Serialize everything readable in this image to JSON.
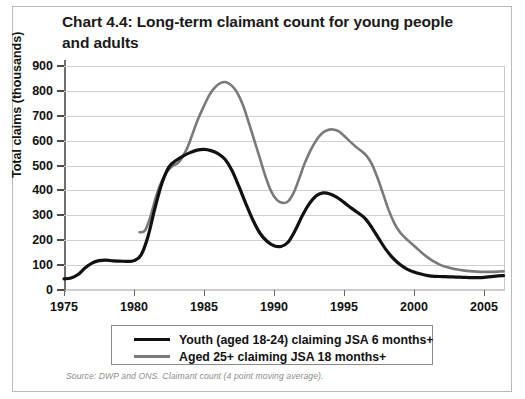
{
  "figure": {
    "title": "Chart 4.4: Long-term claimant count for young people and adults",
    "source_note": "Source: DWP and ONS. Claimant count (4 point moving average)."
  },
  "legend": {
    "items": [
      {
        "label": "Youth (aged 18-24) claiming JSA 6 months+",
        "color": "#111111",
        "series": "youth"
      },
      {
        "label": "Aged 25+ claiming JSA 18 months+",
        "color": "#7a7a7a",
        "series": "adults"
      }
    ]
  },
  "axis": {
    "y_title": "Total claims (thousands)",
    "y_ticks": [
      "900",
      "800",
      "700",
      "600",
      "500",
      "400",
      "300",
      "200",
      "100",
      "0"
    ],
    "x_ticks": [
      "1975",
      "1980",
      "1985",
      "1990",
      "1995",
      "2000",
      "2005"
    ]
  },
  "chart_data": {
    "type": "line",
    "title": "Chart 4.4: Long-term claimant count for young people and adults",
    "xlabel": "",
    "ylabel": "Total claims (thousands)",
    "xlim": [
      1975,
      2006.5
    ],
    "ylim": [
      0,
      900
    ],
    "yticks": [
      0,
      100,
      200,
      300,
      400,
      500,
      600,
      700,
      800,
      900
    ],
    "xticks": [
      1975,
      1980,
      1985,
      1990,
      1995,
      2000,
      2005
    ],
    "grid": "horizontal",
    "legend_position": "below-plot",
    "annotation": "Source: DWP and ONS. Claimant count (4 point moving average).",
    "series": [
      {
        "name": "Youth (aged 18-24) claiming JSA 6 months+",
        "color": "#111111",
        "points": [
          [
            1975.0,
            45
          ],
          [
            1975.5,
            48
          ],
          [
            1976.0,
            62
          ],
          [
            1976.5,
            88
          ],
          [
            1977.0,
            108
          ],
          [
            1977.5,
            118
          ],
          [
            1978.0,
            120
          ],
          [
            1978.5,
            117
          ],
          [
            1979.0,
            116
          ],
          [
            1979.5,
            115
          ],
          [
            1980.0,
            118
          ],
          [
            1980.5,
            140
          ],
          [
            1981.0,
            215
          ],
          [
            1981.5,
            330
          ],
          [
            1982.0,
            430
          ],
          [
            1982.5,
            495
          ],
          [
            1983.0,
            520
          ],
          [
            1983.5,
            538
          ],
          [
            1984.0,
            552
          ],
          [
            1984.5,
            562
          ],
          [
            1985.0,
            565
          ],
          [
            1985.5,
            560
          ],
          [
            1986.0,
            548
          ],
          [
            1986.5,
            525
          ],
          [
            1987.0,
            480
          ],
          [
            1987.5,
            415
          ],
          [
            1988.0,
            345
          ],
          [
            1988.5,
            280
          ],
          [
            1989.0,
            228
          ],
          [
            1989.5,
            196
          ],
          [
            1990.0,
            178
          ],
          [
            1990.5,
            175
          ],
          [
            1991.0,
            192
          ],
          [
            1991.5,
            238
          ],
          [
            1992.0,
            296
          ],
          [
            1992.5,
            345
          ],
          [
            1993.0,
            378
          ],
          [
            1993.5,
            390
          ],
          [
            1994.0,
            386
          ],
          [
            1994.5,
            372
          ],
          [
            1995.0,
            352
          ],
          [
            1995.5,
            330
          ],
          [
            1996.0,
            310
          ],
          [
            1996.5,
            288
          ],
          [
            1997.0,
            250
          ],
          [
            1997.5,
            205
          ],
          [
            1998.0,
            162
          ],
          [
            1998.5,
            128
          ],
          [
            1999.0,
            102
          ],
          [
            1999.5,
            84
          ],
          [
            2000.0,
            72
          ],
          [
            2000.5,
            64
          ],
          [
            2001.0,
            58
          ],
          [
            2001.5,
            55
          ],
          [
            2002.0,
            54
          ],
          [
            2002.5,
            53
          ],
          [
            2003.0,
            52
          ],
          [
            2003.5,
            51
          ],
          [
            2004.0,
            50
          ],
          [
            2004.5,
            50
          ],
          [
            2005.0,
            51
          ],
          [
            2005.5,
            54
          ],
          [
            2006.0,
            57
          ],
          [
            2006.4,
            58
          ]
        ]
      },
      {
        "name": "Aged 25+ claiming JSA 18 months+",
        "color": "#7a7a7a",
        "points": [
          [
            1980.4,
            232
          ],
          [
            1980.8,
            240
          ],
          [
            1981.2,
            300
          ],
          [
            1981.6,
            380
          ],
          [
            1982.0,
            440
          ],
          [
            1982.4,
            478
          ],
          [
            1982.8,
            500
          ],
          [
            1983.0,
            505
          ],
          [
            1983.3,
            520
          ],
          [
            1983.8,
            570
          ],
          [
            1984.2,
            630
          ],
          [
            1984.6,
            690
          ],
          [
            1985.0,
            740
          ],
          [
            1985.4,
            785
          ],
          [
            1985.8,
            815
          ],
          [
            1986.2,
            832
          ],
          [
            1986.6,
            835
          ],
          [
            1987.0,
            820
          ],
          [
            1987.4,
            790
          ],
          [
            1987.8,
            740
          ],
          [
            1988.2,
            672
          ],
          [
            1988.6,
            600
          ],
          [
            1989.0,
            528
          ],
          [
            1989.4,
            455
          ],
          [
            1989.8,
            396
          ],
          [
            1990.2,
            362
          ],
          [
            1990.6,
            350
          ],
          [
            1991.0,
            356
          ],
          [
            1991.4,
            390
          ],
          [
            1991.8,
            448
          ],
          [
            1992.2,
            510
          ],
          [
            1992.6,
            560
          ],
          [
            1993.0,
            600
          ],
          [
            1993.4,
            628
          ],
          [
            1993.8,
            642
          ],
          [
            1994.2,
            645
          ],
          [
            1994.6,
            638
          ],
          [
            1995.0,
            620
          ],
          [
            1995.4,
            598
          ],
          [
            1995.8,
            578
          ],
          [
            1996.2,
            560
          ],
          [
            1996.6,
            540
          ],
          [
            1997.0,
            505
          ],
          [
            1997.4,
            450
          ],
          [
            1997.8,
            385
          ],
          [
            1998.2,
            320
          ],
          [
            1998.6,
            268
          ],
          [
            1999.0,
            232
          ],
          [
            1999.4,
            208
          ],
          [
            1999.8,
            188
          ],
          [
            2000.2,
            168
          ],
          [
            2000.6,
            148
          ],
          [
            2001.0,
            130
          ],
          [
            2001.4,
            115
          ],
          [
            2001.8,
            103
          ],
          [
            2002.2,
            94
          ],
          [
            2002.6,
            88
          ],
          [
            2003.0,
            83
          ],
          [
            2003.5,
            79
          ],
          [
            2004.0,
            76
          ],
          [
            2004.5,
            74
          ],
          [
            2005.0,
            73
          ],
          [
            2005.5,
            73
          ],
          [
            2006.0,
            74
          ],
          [
            2006.4,
            75
          ]
        ]
      }
    ]
  }
}
